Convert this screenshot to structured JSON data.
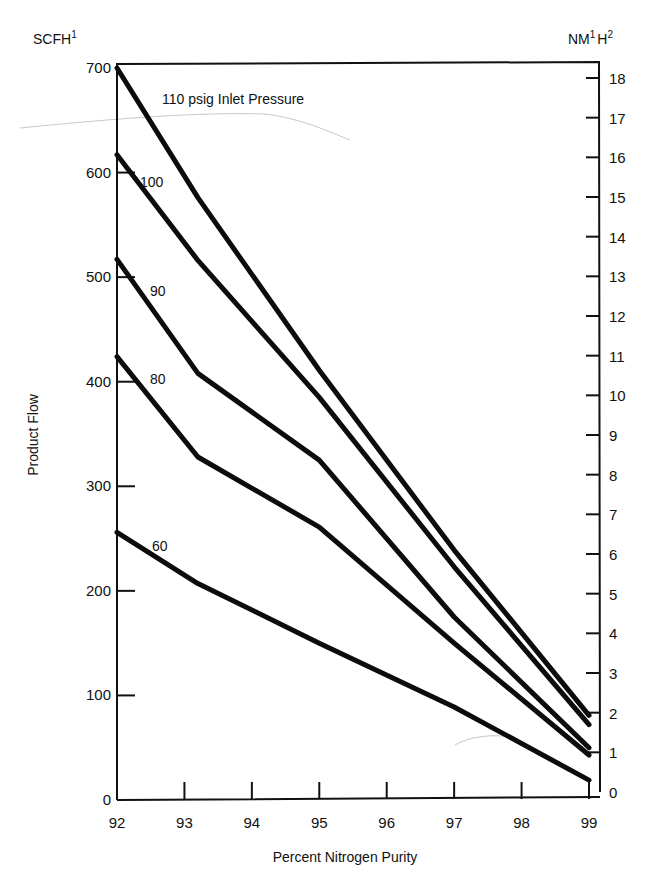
{
  "chart_data": {
    "type": "line",
    "title": "",
    "xlabel": "Percent Nitrogen Purity",
    "ylabel": "Product Flow",
    "left_unit": "SCFH",
    "left_unit_sup": "1",
    "right_unit": "NM",
    "right_unit_sup1": "1",
    "right_unit_mid": "H",
    "right_unit_sup2": "2",
    "xlim": [
      92,
      99
    ],
    "ylim": [
      0,
      700
    ],
    "y2lim": [
      0,
      18
    ],
    "grid": false,
    "legend": "inline labels",
    "x_ticks": [
      92,
      93,
      94,
      95,
      96,
      97,
      98,
      99
    ],
    "y_ticks": [
      0,
      100,
      200,
      300,
      400,
      500,
      600,
      700
    ],
    "y2_ticks": [
      0,
      1,
      2,
      3,
      4,
      5,
      6,
      7,
      8,
      9,
      10,
      11,
      12,
      13,
      14,
      15,
      16,
      17,
      18
    ],
    "x": [
      92,
      93.2,
      95,
      97,
      99
    ],
    "series": [
      {
        "name": "110 psig Inlet Pressure",
        "label": "110 psig Inlet Pressure",
        "values": [
          700,
          576,
          411,
          239,
          81
        ]
      },
      {
        "name": "100 psig",
        "label": "100",
        "values": [
          617,
          516,
          385,
          223,
          72
        ]
      },
      {
        "name": "90 psig",
        "label": "90",
        "values": [
          517,
          408,
          325,
          175,
          50
        ]
      },
      {
        "name": "80 psig",
        "label": "80",
        "values": [
          424,
          328,
          261,
          150,
          43
        ]
      },
      {
        "name": "60 psig",
        "label": "60",
        "values": [
          256,
          207,
          150,
          89,
          19
        ]
      }
    ]
  }
}
